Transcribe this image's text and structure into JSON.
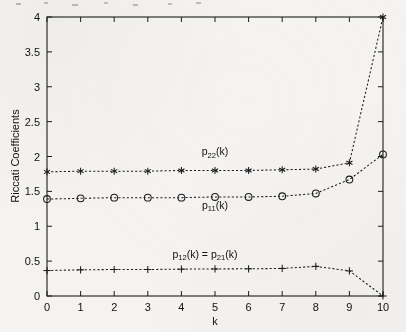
{
  "figure": {
    "background_color": "#f4f3f1",
    "ink_color": "#1b1b1b"
  },
  "chart_data": {
    "type": "line",
    "title": "",
    "xlabel": "k",
    "ylabel": "Riccati Coefficients",
    "xlim": [
      0,
      10
    ],
    "ylim": [
      0,
      4
    ],
    "grid": false,
    "legend_position": "inline-annotations",
    "x": [
      0,
      1,
      2,
      3,
      4,
      5,
      6,
      7,
      8,
      9,
      10
    ],
    "xticks": [
      "0",
      "1",
      "2",
      "3",
      "4",
      "5",
      "6",
      "7",
      "8",
      "9",
      "10"
    ],
    "yticks": [
      "0",
      "0.5",
      "1",
      "1.5",
      "2",
      "2.5",
      "3",
      "3.5",
      "4"
    ],
    "series": [
      {
        "name": "p22(k)",
        "label_main": "p",
        "label_sub": "22",
        "label_tail": "(k)",
        "marker": "asterisk",
        "linestyle": "dotted",
        "values": [
          1.78,
          1.79,
          1.79,
          1.79,
          1.8,
          1.8,
          1.8,
          1.81,
          1.82,
          1.91,
          4.0
        ]
      },
      {
        "name": "p11(k)",
        "label_main": "p",
        "label_sub": "11",
        "label_tail": "(k)",
        "marker": "circle",
        "linestyle": "dotted",
        "values": [
          1.39,
          1.4,
          1.41,
          1.41,
          1.41,
          1.42,
          1.42,
          1.43,
          1.47,
          1.67,
          2.03
        ]
      },
      {
        "name": "p12(k) = p21(k)",
        "label_main": "p",
        "label_sub": "12",
        "label_tail": "(k) = p",
        "label_sub2": "21",
        "label_tail2": "(k)",
        "marker": "plus",
        "linestyle": "dotted",
        "values": [
          0.365,
          0.375,
          0.38,
          0.38,
          0.385,
          0.388,
          0.39,
          0.395,
          0.425,
          0.36,
          0.0
        ]
      }
    ],
    "annotations": [
      {
        "text": "p22(k)",
        "x": 5.0,
        "y": 2.02
      },
      {
        "text": "p11(k)",
        "x": 5.0,
        "y": 1.25
      },
      {
        "text": "p12(k) = p21(k)",
        "x": 4.7,
        "y": 0.55
      }
    ]
  }
}
